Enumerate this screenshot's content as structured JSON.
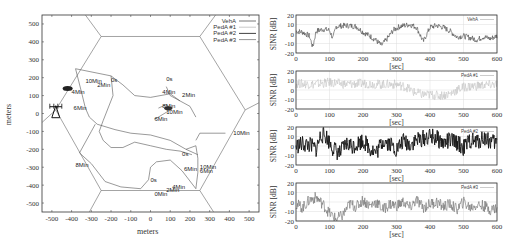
{
  "chart_data": [
    {
      "type": "line",
      "title": "",
      "xlabel": "meters",
      "ylabel": "meters",
      "xlim": [
        -550,
        550
      ],
      "ylim": [
        -550,
        550
      ],
      "xticks": [
        "-500",
        "-400",
        "-300",
        "-200",
        "-100",
        "0",
        "100",
        "200",
        "300",
        "400",
        "500"
      ],
      "yticks": [
        "500",
        "400",
        "300",
        "200",
        "100",
        "0",
        "-100",
        "-200",
        "-300",
        "-400",
        "-500"
      ],
      "legend": [
        "VehA",
        "PedA #1",
        "PedA #2",
        "PedA #3"
      ],
      "legend_position": "upper right",
      "annotations": [
        "10Min",
        "0s",
        "2Min",
        "4Min",
        "6Min",
        "8Min",
        "0s",
        "4Min",
        "2Min",
        "8Min",
        "10Min",
        "6Min",
        "10Min",
        "0s",
        "8Min",
        "6Min",
        "10Min",
        "0s",
        "4Min",
        "2Min",
        "10Min",
        "0Min",
        "6Min"
      ],
      "base_station": {
        "x": -480,
        "y": 10
      }
    },
    {
      "type": "line",
      "xlabel": "[sec]",
      "ylabel": "SINR [dB]",
      "xlim": [
        0,
        600
      ],
      "ylim": [
        -20,
        20
      ],
      "xticks": [
        "0",
        "100",
        "200",
        "300",
        "400",
        "500",
        "600"
      ],
      "yticks": [
        "20",
        "10",
        "0",
        "-10",
        "-20"
      ],
      "series": [
        {
          "name": "VehA",
          "x": [
            0,
            20,
            40,
            50,
            60,
            80,
            100,
            110,
            120,
            150,
            180,
            200,
            220,
            240,
            255,
            270,
            290,
            310,
            340,
            360,
            380,
            400,
            420,
            440,
            460,
            480,
            500,
            520,
            540,
            560,
            580,
            600
          ],
          "values": [
            3,
            2,
            -2,
            -14,
            3,
            5,
            4,
            -5,
            8,
            9,
            8,
            2,
            -2,
            -7,
            -12,
            -6,
            4,
            8,
            10,
            7,
            -8,
            7,
            9,
            7,
            3,
            -3,
            -2,
            -4,
            -6,
            -3,
            -5,
            -2
          ]
        }
      ]
    },
    {
      "type": "line",
      "xlabel": "[sec]",
      "ylabel": "SINR [dB]",
      "xlim": [
        0,
        600
      ],
      "ylim": [
        -20,
        20
      ],
      "xticks": [
        "0",
        "100",
        "200",
        "300",
        "400",
        "500",
        "600"
      ],
      "yticks": [
        "20",
        "10",
        "0",
        "-10",
        "-20"
      ],
      "series": [
        {
          "name": "PedA #1",
          "x": [
            0,
            50,
            100,
            150,
            200,
            250,
            300,
            330,
            350,
            380,
            400,
            430,
            460,
            480,
            500,
            530,
            560,
            600
          ],
          "values": [
            7,
            6,
            8,
            6,
            7,
            6,
            6,
            3,
            -2,
            -5,
            -5,
            -6,
            -4,
            0,
            3,
            4,
            5,
            6
          ]
        }
      ]
    },
    {
      "type": "line",
      "xlabel": "[sec]",
      "ylabel": "SINR [dB]",
      "xlim": [
        0,
        600
      ],
      "ylim": [
        -20,
        20
      ],
      "xticks": [
        "0",
        "100",
        "200",
        "300",
        "400",
        "500",
        "600"
      ],
      "yticks": [
        "20",
        "10",
        "0",
        "-10",
        "-20"
      ],
      "series": [
        {
          "name": "PedA #2",
          "x": [
            0,
            20,
            40,
            60,
            75,
            90,
            110,
            130,
            150,
            170,
            200,
            220,
            240,
            260,
            280,
            300,
            320,
            340,
            360,
            380,
            400,
            420,
            440,
            460,
            480,
            500,
            520,
            540,
            560,
            580,
            600
          ],
          "values": [
            0,
            2,
            1,
            -3,
            12,
            10,
            -2,
            -8,
            2,
            0,
            6,
            -2,
            -7,
            6,
            3,
            -4,
            5,
            2,
            6,
            8,
            10,
            8,
            3,
            6,
            4,
            -2,
            6,
            4,
            9,
            5,
            3
          ]
        }
      ]
    },
    {
      "type": "line",
      "xlabel": "[sec]",
      "ylabel": "SINR [dB]",
      "xlim": [
        0,
        600
      ],
      "ylim": [
        -20,
        20
      ],
      "xticks": [
        "0",
        "100",
        "200",
        "300",
        "400",
        "500",
        "600"
      ],
      "yticks": [
        "20",
        "10",
        "0",
        "-10",
        "-20"
      ],
      "series": [
        {
          "name": "PedA #3",
          "x": [
            0,
            20,
            40,
            60,
            80,
            100,
            120,
            140,
            160,
            180,
            200,
            220,
            240,
            260,
            280,
            300,
            320,
            340,
            360,
            380,
            400,
            420,
            440,
            460,
            480,
            500,
            520,
            540,
            560,
            580,
            600
          ],
          "values": [
            -2,
            -6,
            2,
            5,
            -2,
            -12,
            -18,
            -14,
            -2,
            -5,
            2,
            -4,
            0,
            -8,
            -2,
            -4,
            0,
            -6,
            2,
            -6,
            -2,
            0,
            -5,
            -2,
            -8,
            0,
            -6,
            -3,
            -4,
            -8,
            -6
          ]
        }
      ]
    }
  ],
  "map": {
    "xlabel": "meters",
    "ylabel": "meters",
    "legend": [
      {
        "label": "VehA",
        "color": "#555555"
      },
      {
        "label": "PedA #1",
        "color": "#bbbbbb"
      },
      {
        "label": "PedA #2",
        "color": "#111111"
      },
      {
        "label": "PedA #3",
        "color": "#777777"
      }
    ]
  },
  "panels": [
    {
      "legend": "VehA",
      "color": "#444444",
      "ylabel": "SINR [dB]",
      "xlabel": "[sec]"
    },
    {
      "legend": "PedA #1",
      "color": "#c4c4c4",
      "ylabel": "SINR [dB]",
      "xlabel": "[sec]"
    },
    {
      "legend": "PedA #2",
      "color": "#111111",
      "ylabel": "SINR [dB]",
      "xlabel": "[sec]"
    },
    {
      "legend": "PedA #3",
      "color": "#6e6e6e",
      "ylabel": "SINR [dB]",
      "xlabel": "[sec]"
    }
  ]
}
